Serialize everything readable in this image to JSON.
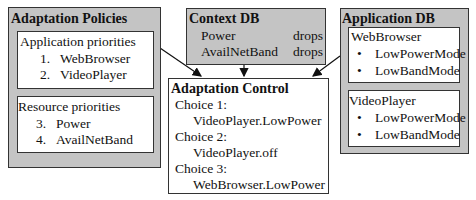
{
  "policies": {
    "title": "Adaptation Policies",
    "app": {
      "heading": "Application priorities",
      "items": [
        {
          "num": "1.",
          "label": "WebBrowser"
        },
        {
          "num": "2.",
          "label": "VideoPlayer"
        }
      ]
    },
    "res": {
      "heading": "Resource priorities",
      "items": [
        {
          "num": "3.",
          "label": "Power"
        },
        {
          "num": "4.",
          "label": "AvailNetBand"
        }
      ]
    }
  },
  "context": {
    "title": "Context DB",
    "rows": [
      {
        "name": "Power",
        "state": "drops"
      },
      {
        "name": "AvailNetBand",
        "state": "drops"
      }
    ]
  },
  "control": {
    "title": "Adaptation Control",
    "choices": [
      {
        "label": "Choice 1:",
        "value": "VideoPlayer.LowPower"
      },
      {
        "label": "Choice 2:",
        "value": "VideoPlayer.off"
      },
      {
        "label": "Choice 3:",
        "value": "WebBrowser.LowPower"
      }
    ]
  },
  "appdb": {
    "title": "Application DB",
    "apps": [
      {
        "name": "WebBrowser",
        "modes": [
          "LowPowerMode",
          "LowBandMode"
        ]
      },
      {
        "name": "VideoPlayer",
        "modes": [
          "LowPowerMode",
          "LowBandMode"
        ]
      }
    ]
  },
  "bullet": "•"
}
